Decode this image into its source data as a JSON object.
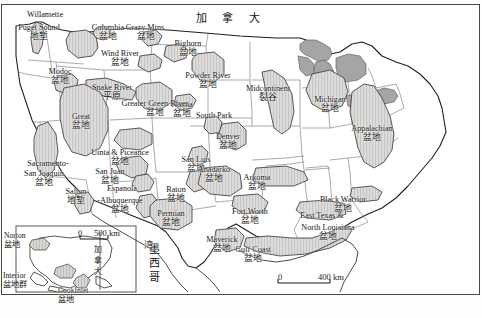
{
  "map": {
    "title_visible": false,
    "country_labels": [
      {
        "name": "canada-label",
        "text": "加 拿 大",
        "x": 196,
        "y": 13,
        "size": 11,
        "spaced": true
      },
      {
        "name": "mexico-label",
        "text": "墨西哥",
        "x": 148,
        "y": 243,
        "size": 11,
        "vertical": true
      },
      {
        "name": "inset-canada-label",
        "text": "加拿大",
        "x": 92,
        "y": 245,
        "size": 8,
        "vertical": true
      },
      {
        "name": "gulf-label",
        "text": "湾",
        "x": 143,
        "y": 240,
        "size": 9,
        "vertical": true
      }
    ],
    "basin_labels": [
      {
        "name": "willamette",
        "en": "Willamette",
        "cn": "",
        "x": 45,
        "y": 11,
        "size": 8.2
      },
      {
        "name": "puget-sound",
        "en": "Puget Sound",
        "cn": "地堑",
        "x": 39,
        "y": 24,
        "size": 8.2
      },
      {
        "name": "columbia",
        "en": "Columbia",
        "cn": "盆地",
        "x": 108,
        "y": 24,
        "size": 8.2
      },
      {
        "name": "crazy-mtns",
        "en": "Crazy Mtns.",
        "cn": "盆地",
        "x": 146,
        "y": 24,
        "size": 8.2
      },
      {
        "name": "bighorn",
        "en": "Bighorn",
        "cn": "盆地",
        "x": 188,
        "y": 40,
        "size": 8.2
      },
      {
        "name": "wind-river",
        "en": "Wind River",
        "cn": "盆地",
        "x": 120,
        "y": 50,
        "size": 8.2
      },
      {
        "name": "modoc",
        "en": "Modoc",
        "cn": "盆地",
        "x": 60,
        "y": 68,
        "size": 8.2
      },
      {
        "name": "snake-river",
        "en": "Snake River",
        "cn": "平原",
        "x": 112,
        "y": 84,
        "size": 8.2
      },
      {
        "name": "powder-river",
        "en": "Powder River",
        "cn": "盆地",
        "x": 208,
        "y": 72,
        "size": 8.2
      },
      {
        "name": "hanna",
        "en": "Hanna",
        "cn": "盆地",
        "x": 182,
        "y": 101,
        "size": 8.2
      },
      {
        "name": "greater-green-river",
        "en": "Greater Green River",
        "cn": "盆地",
        "x": 155,
        "y": 100,
        "size": 8.2
      },
      {
        "name": "midcontinent",
        "en": "Midcontinent",
        "cn": "裂谷",
        "x": 268,
        "y": 85,
        "size": 8.2
      },
      {
        "name": "michigan",
        "en": "Michigan",
        "cn": "盆地",
        "x": 330,
        "y": 96,
        "size": 8.2
      },
      {
        "name": "appalachian",
        "en": "Appalachian",
        "cn": "盆地",
        "x": 372,
        "y": 125,
        "size": 8.2
      },
      {
        "name": "great",
        "en": "Great",
        "cn": "盆地",
        "x": 81,
        "y": 113,
        "size": 8.2
      },
      {
        "name": "south-park",
        "en": "South Park",
        "cn": "",
        "x": 214,
        "y": 112,
        "size": 8.2
      },
      {
        "name": "denver",
        "en": "Denver",
        "cn": "盆地",
        "x": 228,
        "y": 133,
        "size": 8.2
      },
      {
        "name": "uinta-piceance",
        "en": "Uinta & Piceance",
        "cn": "盆地",
        "x": 120,
        "y": 149,
        "size": 8.2
      },
      {
        "name": "sacramento-san-joaquin",
        "en": "Sacramento-",
        "cn": "",
        "x": 48,
        "y": 160,
        "size": 8.2
      },
      {
        "name": "san-joaquin",
        "en": "San Joaquin",
        "cn": "盆地",
        "x": 44,
        "y": 170,
        "size": 8.2
      },
      {
        "name": "san-juan",
        "en": "San Juan",
        "cn": "盆地",
        "x": 110,
        "y": 168,
        "size": 8.2
      },
      {
        "name": "san-luis",
        "en": "San Luis",
        "cn": "盆地",
        "x": 196,
        "y": 156,
        "size": 8.2
      },
      {
        "name": "anadarko",
        "en": "Anadarko",
        "cn": "盆地",
        "x": 214,
        "y": 166,
        "size": 8.2
      },
      {
        "name": "arkoma",
        "en": "Arkoma",
        "cn": "盆地",
        "x": 257,
        "y": 174,
        "size": 8.2
      },
      {
        "name": "salton",
        "en": "Salton",
        "cn": "地堑",
        "x": 76,
        "y": 188,
        "size": 8.2
      },
      {
        "name": "espanola",
        "en": "Espanola",
        "cn": "",
        "x": 122,
        "y": 185,
        "size": 8.2
      },
      {
        "name": "albuquerque",
        "en": "-Albuquerque",
        "cn": "盆地",
        "x": 120,
        "y": 197,
        "size": 8.2
      },
      {
        "name": "raton",
        "en": "Raton",
        "cn": "盆地",
        "x": 176,
        "y": 186,
        "size": 8.2
      },
      {
        "name": "permian",
        "en": "Permian",
        "cn": "盆地",
        "x": 171,
        "y": 210,
        "size": 8.2
      },
      {
        "name": "fort-worth",
        "en": "Fort Worth",
        "cn": "盆地",
        "x": 250,
        "y": 208,
        "size": 8.2
      },
      {
        "name": "black-warrior",
        "en": "Black Warrior",
        "cn": "盆地",
        "x": 343,
        "y": 196,
        "size": 8.2
      },
      {
        "name": "east-texas",
        "en": "East Texas &",
        "cn": "",
        "x": 322,
        "y": 212,
        "size": 8.2
      },
      {
        "name": "north-louisiana",
        "en": "North Louisiana",
        "cn": "盆地",
        "x": 328,
        "y": 224,
        "size": 8.2
      },
      {
        "name": "maverick",
        "en": "Maverick",
        "cn": "盆地",
        "x": 222,
        "y": 236,
        "size": 8.2
      },
      {
        "name": "gulf-coast",
        "en": "Gulf Coast",
        "cn": "盆地",
        "x": 253,
        "y": 246,
        "size": 8.2
      }
    ],
    "inset_labels": [
      {
        "name": "norton",
        "en": "Norton",
        "cn": "盆地",
        "x": 4,
        "y": 232,
        "size": 7.6
      },
      {
        "name": "interior",
        "en": "Interior",
        "cn": "盆地群",
        "x": 3,
        "y": 272,
        "size": 7.6
      },
      {
        "name": "cook-inlet",
        "en": "CookInlet",
        "cn": "盆地",
        "x": 58,
        "y": 287,
        "size": 7.6
      }
    ],
    "scale_bars": [
      {
        "name": "main-scale",
        "zero": "0",
        "value": "400 km",
        "x": 278,
        "y": 272,
        "length": 52
      },
      {
        "name": "inset-scale",
        "zero": "0",
        "value": "500 km",
        "x": 78,
        "y": 228,
        "length": 28
      }
    ],
    "colors": {
      "basin_fill": "#d4d3d0",
      "basin_stroke": "#3c3c3c",
      "state_stroke": "#6e6e6e",
      "country_stroke": "#1f1f1f",
      "frame": "#4a4a4a",
      "great_lakes": "#a9a9a9",
      "background": "#fdfdfc"
    }
  }
}
